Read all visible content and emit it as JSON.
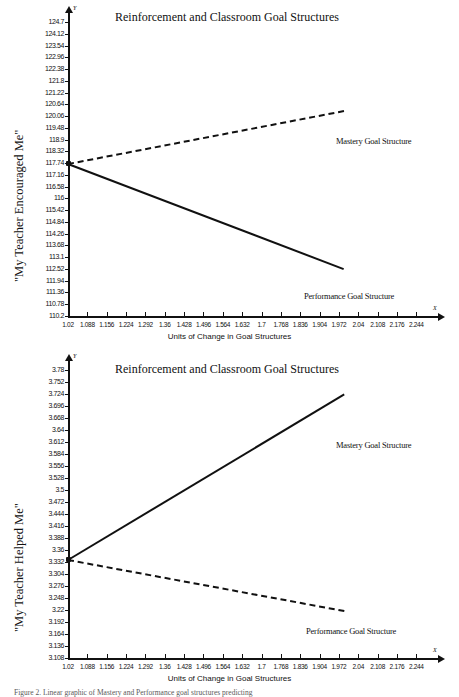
{
  "figure": {
    "caption": "Figure 2. Linear graphic of Mastery and Performance goal structures predicting",
    "axis_letters": {
      "y": "Y",
      "x": "X"
    }
  },
  "charts": [
    {
      "id": "chart-1",
      "title": "Reinforcement and Classroom Goal Structures",
      "xlabel": "Units of Change in Goal Structures",
      "ylabel": "\"My Teacher Encouraged Me\"",
      "series_labels": {
        "mastery": "Mastery Goal Structure",
        "performance": "Performance Goal Structure"
      },
      "ytick_labels": [
        "124.7",
        "124.12",
        "123.54",
        "122.96",
        "122.38",
        "121.8",
        "121.22",
        "120.64",
        "120.06",
        "119.48",
        "118.9",
        "118.32",
        "117.74",
        "117.16",
        "116.58",
        "116",
        "115.42",
        "114.84",
        "114.26",
        "113.68",
        "113.1",
        "112.52",
        "111.94",
        "111.36",
        "110.78",
        "110.2"
      ],
      "xtick_labels": [
        "1.02",
        "1.088",
        "1.156",
        "1.224",
        "1.292",
        "1.36",
        "1.428",
        "1.496",
        "1.564",
        "1.632",
        "1.7",
        "1.768",
        "1.836",
        "1.904",
        "1.972",
        "2.04",
        "2.108",
        "2.176",
        "2.244"
      ]
    },
    {
      "id": "chart-2",
      "title": "Reinforcement and Classroom Goal Structures",
      "xlabel": "Units of Change in Goal Structures",
      "ylabel": "\"My Teacher Helped Me\"",
      "series_labels": {
        "mastery": "Mastery Goal Structure",
        "performance": "Performance Goal Structure"
      },
      "ytick_labels": [
        "3.78",
        "3.752",
        "3.724",
        "3.696",
        "3.668",
        "3.64",
        "3.612",
        "3.584",
        "3.556",
        "3.528",
        "3.5",
        "3.472",
        "3.444",
        "3.416",
        "3.388",
        "3.36",
        "3.332",
        "3.304",
        "3.276",
        "3.248",
        "3.22",
        "3.192",
        "3.164",
        "3.136",
        "3.108"
      ],
      "xtick_labels": [
        "1.02",
        "1.088",
        "1.156",
        "1.224",
        "1.292",
        "1.36",
        "1.428",
        "1.496",
        "1.564",
        "1.632",
        "1.7",
        "1.768",
        "1.836",
        "1.904",
        "1.972",
        "2.04",
        "2.108",
        "2.176",
        "2.244"
      ]
    }
  ],
  "chart_data": [
    {
      "type": "line",
      "title": "Reinforcement and Classroom Goal Structures",
      "xlabel": "Units of Change in Goal Structures",
      "ylabel": "\"My Teacher Encouraged Me\"",
      "xlim": [
        1.02,
        2.278
      ],
      "ylim": [
        110.2,
        124.7
      ],
      "ytick_values": [
        124.7,
        124.12,
        123.54,
        122.96,
        122.38,
        121.8,
        121.22,
        120.64,
        120.06,
        119.48,
        118.9,
        118.32,
        117.74,
        117.16,
        116.58,
        116,
        115.42,
        114.84,
        114.26,
        113.68,
        113.1,
        112.52,
        111.94,
        111.36,
        110.78,
        110.2
      ],
      "xtick_values": [
        1.02,
        1.088,
        1.156,
        1.224,
        1.292,
        1.36,
        1.428,
        1.496,
        1.564,
        1.632,
        1.7,
        1.768,
        1.836,
        1.904,
        1.972,
        2.04,
        2.108,
        2.176,
        2.244
      ],
      "grid": false,
      "legend": "inline-right",
      "series": [
        {
          "name": "Mastery Goal Structure",
          "style": "dashed",
          "x": [
            1.02,
            1.99
          ],
          "y": [
            117.74,
            120.35
          ]
        },
        {
          "name": "Performance Goal Structure",
          "style": "solid",
          "x": [
            1.02,
            1.99
          ],
          "y": [
            117.74,
            112.55
          ]
        }
      ]
    },
    {
      "type": "line",
      "title": "Reinforcement and Classroom Goal Structures",
      "xlabel": "Units of Change in Goal Structures",
      "ylabel": "\"My Teacher Helped Me\"",
      "xlim": [
        1.02,
        2.278
      ],
      "ylim": [
        3.108,
        3.78
      ],
      "ytick_values": [
        3.78,
        3.752,
        3.724,
        3.696,
        3.668,
        3.64,
        3.612,
        3.584,
        3.556,
        3.528,
        3.5,
        3.472,
        3.444,
        3.416,
        3.388,
        3.36,
        3.332,
        3.304,
        3.276,
        3.248,
        3.22,
        3.192,
        3.164,
        3.136,
        3.108
      ],
      "xtick_values": [
        1.02,
        1.088,
        1.156,
        1.224,
        1.292,
        1.36,
        1.428,
        1.496,
        1.564,
        1.632,
        1.7,
        1.768,
        1.836,
        1.904,
        1.972,
        2.04,
        2.108,
        2.176,
        2.244
      ],
      "grid": false,
      "legend": "inline-right",
      "series": [
        {
          "name": "Mastery Goal Structure",
          "style": "solid",
          "x": [
            1.02,
            1.99
          ],
          "y": [
            3.338,
            3.724
          ]
        },
        {
          "name": "Performance Goal Structure",
          "style": "dashed",
          "x": [
            1.02,
            1.99
          ],
          "y": [
            3.338,
            3.219
          ]
        }
      ]
    }
  ]
}
